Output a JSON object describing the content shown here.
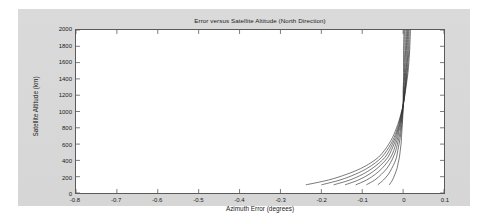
{
  "figure": {
    "background_color": "#d9d9d9",
    "axes_background_color": "#ffffff",
    "axes_border_color": "#5a5a5a",
    "line_color": "#303030"
  },
  "chart_data": {
    "type": "line",
    "title": "Error versus Satellite Altitude (North Direction)",
    "xlabel": "Azimuth Error (degrees)",
    "ylabel": "Satellite Altitude (km)",
    "xlim": [
      -0.8,
      0.1
    ],
    "ylim": [
      0,
      2000
    ],
    "xticks": [
      -0.8,
      -0.7,
      -0.6,
      -0.5,
      -0.4,
      -0.3,
      -0.2,
      -0.1,
      0,
      0.1
    ],
    "xtick_labels": [
      "-0.8",
      "-0.7",
      "-0.6",
      "-0.5",
      "-0.4",
      "-0.3",
      "-0.2",
      "-0.1",
      "0",
      "0.1"
    ],
    "yticks": [
      0,
      200,
      400,
      600,
      800,
      1000,
      1200,
      1400,
      1600,
      1800,
      2000
    ],
    "ytick_labels": [
      "0",
      "200",
      "400",
      "600",
      "800",
      "1000",
      "1200",
      "1400",
      "1600",
      "1800",
      "2000"
    ],
    "grid": false,
    "legend": null,
    "legend_position": "none",
    "x_is_error": true,
    "y_is_altitude": true,
    "annotation": "Eight curves fan out from a common pinch point near (0, 1000); below the pinch they sweep left to negative azimuth error, above it they splay slightly right.",
    "series": [
      {
        "name": "curve-1",
        "x": [
          -0.238,
          -0.182,
          -0.138,
          -0.104,
          -0.079,
          -0.06,
          -0.046,
          -0.035,
          -0.026,
          -0.019,
          -0.013,
          -0.008,
          -0.004,
          0.0,
          0.003,
          0.006,
          0.009,
          0.012,
          0.014,
          0.016,
          0.018
        ],
        "y": [
          100,
          160,
          230,
          300,
          370,
          440,
          520,
          600,
          680,
          760,
          840,
          920,
          1000,
          1070,
          1160,
          1260,
          1370,
          1480,
          1600,
          1750,
          2000
        ]
      },
      {
        "name": "curve-2",
        "x": [
          -0.2,
          -0.154,
          -0.117,
          -0.089,
          -0.068,
          -0.052,
          -0.04,
          -0.03,
          -0.022,
          -0.016,
          -0.011,
          -0.007,
          -0.003,
          0.0,
          0.003,
          0.005,
          0.008,
          0.01,
          0.012,
          0.014,
          0.015
        ],
        "y": [
          100,
          160,
          230,
          300,
          370,
          440,
          520,
          600,
          680,
          760,
          840,
          920,
          1000,
          1070,
          1160,
          1260,
          1370,
          1480,
          1600,
          1750,
          2000
        ]
      },
      {
        "name": "curve-3",
        "x": [
          -0.17,
          -0.13,
          -0.099,
          -0.076,
          -0.058,
          -0.044,
          -0.034,
          -0.026,
          -0.019,
          -0.014,
          -0.009,
          -0.006,
          -0.003,
          0.0,
          0.002,
          0.005,
          0.007,
          0.009,
          0.01,
          0.012,
          0.013
        ],
        "y": [
          100,
          160,
          230,
          300,
          370,
          440,
          520,
          600,
          680,
          760,
          840,
          920,
          1000,
          1070,
          1160,
          1260,
          1370,
          1480,
          1600,
          1750,
          2000
        ]
      },
      {
        "name": "curve-4",
        "x": [
          -0.142,
          -0.109,
          -0.083,
          -0.064,
          -0.049,
          -0.037,
          -0.029,
          -0.022,
          -0.016,
          -0.012,
          -0.008,
          -0.005,
          -0.002,
          0.0,
          0.002,
          0.004,
          0.006,
          0.007,
          0.009,
          0.01,
          0.011
        ],
        "y": [
          100,
          160,
          230,
          300,
          370,
          440,
          520,
          600,
          680,
          760,
          840,
          920,
          1000,
          1070,
          1160,
          1260,
          1370,
          1480,
          1600,
          1750,
          2000
        ]
      },
      {
        "name": "curve-5",
        "x": [
          -0.116,
          -0.089,
          -0.068,
          -0.052,
          -0.04,
          -0.03,
          -0.023,
          -0.018,
          -0.013,
          -0.01,
          -0.006,
          -0.004,
          -0.002,
          0.0,
          0.002,
          0.003,
          0.005,
          0.006,
          0.007,
          0.008,
          0.009
        ],
        "y": [
          100,
          160,
          230,
          300,
          370,
          440,
          520,
          600,
          680,
          760,
          840,
          920,
          1000,
          1070,
          1160,
          1260,
          1370,
          1480,
          1600,
          1750,
          2000
        ]
      },
      {
        "name": "curve-6",
        "x": [
          -0.09,
          -0.069,
          -0.053,
          -0.04,
          -0.031,
          -0.024,
          -0.018,
          -0.014,
          -0.01,
          -0.007,
          -0.005,
          -0.003,
          -0.001,
          0.0,
          0.001,
          0.002,
          0.003,
          0.004,
          0.005,
          0.006,
          0.007
        ],
        "y": [
          100,
          160,
          230,
          300,
          370,
          440,
          520,
          600,
          680,
          760,
          840,
          920,
          1000,
          1070,
          1160,
          1260,
          1370,
          1480,
          1600,
          1750,
          2000
        ]
      },
      {
        "name": "curve-7",
        "x": [
          -0.062,
          -0.048,
          -0.036,
          -0.028,
          -0.021,
          -0.016,
          -0.013,
          -0.01,
          -0.007,
          -0.005,
          -0.003,
          -0.002,
          -0.001,
          0.0,
          0.001,
          0.001,
          0.002,
          0.003,
          0.003,
          0.004,
          0.004
        ],
        "y": [
          100,
          160,
          230,
          300,
          370,
          440,
          520,
          600,
          680,
          760,
          840,
          920,
          1000,
          1070,
          1160,
          1260,
          1370,
          1480,
          1600,
          1750,
          2000
        ]
      },
      {
        "name": "curve-8",
        "x": [
          -0.034,
          -0.026,
          -0.02,
          -0.015,
          -0.012,
          -0.009,
          -0.007,
          -0.005,
          -0.004,
          -0.003,
          -0.002,
          -0.001,
          0.0,
          0.0,
          0.0,
          0.0,
          0.001,
          0.001,
          0.001,
          0.001,
          0.002
        ],
        "y": [
          100,
          160,
          230,
          300,
          370,
          440,
          520,
          600,
          680,
          760,
          840,
          920,
          1000,
          1070,
          1160,
          1260,
          1370,
          1480,
          1600,
          1750,
          2000
        ]
      }
    ]
  }
}
